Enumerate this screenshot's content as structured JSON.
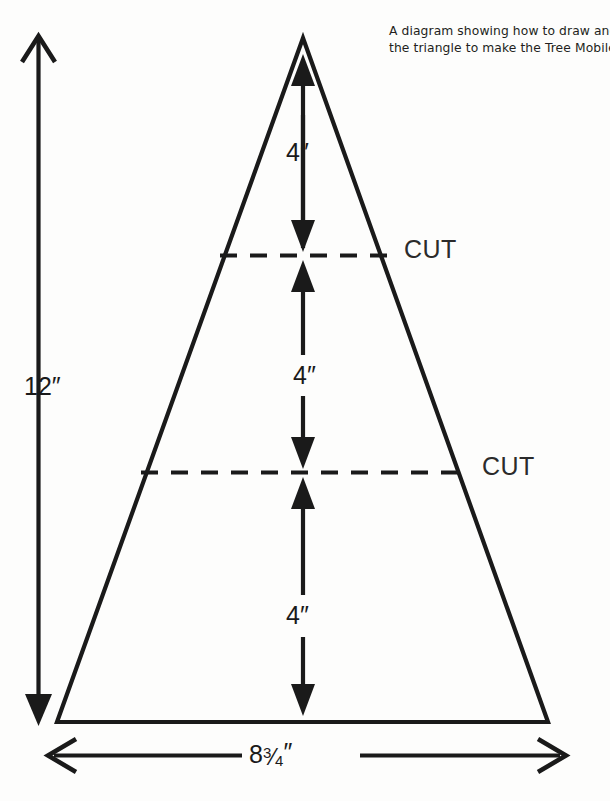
{
  "caption": {
    "line1": "A diagram showing how to draw and cut",
    "line2": "the triangle to make the Tree Mobile."
  },
  "diagram": {
    "shape": "triangle",
    "stroke_color": "#1a1a1a",
    "background_color": "#fdfdfc",
    "dimensions": {
      "height_label": "12″",
      "base_label_whole": "8",
      "base_label_numerator": "3",
      "base_label_slash": "⁄",
      "base_label_denominator": "4",
      "base_label_prime": "″",
      "segment_label": "4″"
    },
    "segments": [
      {
        "name": "top-segment",
        "label": "4″"
      },
      {
        "name": "middle-segment",
        "label": "4″"
      },
      {
        "name": "bottom-segment",
        "label": "4″"
      }
    ],
    "cut_lines": [
      {
        "name": "upper-cut-line",
        "label": "CUT",
        "style": "dashed"
      },
      {
        "name": "lower-cut-line",
        "label": "CUT",
        "style": "dashed"
      }
    ]
  }
}
